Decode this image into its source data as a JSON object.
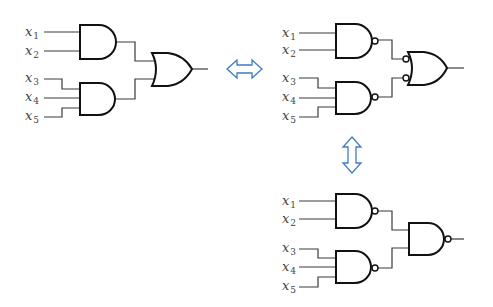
{
  "diagram": {
    "type": "logic-circuit-equivalence",
    "circuits": [
      {
        "id": "and-or",
        "position": "top-left",
        "inputs": [
          {
            "var": "x",
            "sub": "1"
          },
          {
            "var": "x",
            "sub": "2"
          },
          {
            "var": "x",
            "sub": "3"
          },
          {
            "var": "x",
            "sub": "4"
          },
          {
            "var": "x",
            "sub": "5"
          }
        ],
        "gates": [
          {
            "name": "and-gate-1",
            "kind": "AND",
            "inputs": [
              "x1",
              "x2"
            ]
          },
          {
            "name": "and-gate-2",
            "kind": "AND",
            "inputs": [
              "x3",
              "x4",
              "x5"
            ]
          },
          {
            "name": "or-gate",
            "kind": "OR",
            "inputs": [
              "and-gate-1",
              "and-gate-2"
            ]
          }
        ]
      },
      {
        "id": "nand-negated-or",
        "position": "top-right",
        "inputs": [
          {
            "var": "x",
            "sub": "1"
          },
          {
            "var": "x",
            "sub": "2"
          },
          {
            "var": "x",
            "sub": "3"
          },
          {
            "var": "x",
            "sub": "4"
          },
          {
            "var": "x",
            "sub": "5"
          }
        ],
        "gates": [
          {
            "name": "nand-gate-1",
            "kind": "NAND",
            "inputs": [
              "x1",
              "x2"
            ]
          },
          {
            "name": "nand-gate-2",
            "kind": "NAND",
            "inputs": [
              "x3",
              "x4",
              "x5"
            ]
          },
          {
            "name": "or-gate-inverted-inputs",
            "kind": "OR (inverted inputs)",
            "inputs": [
              "nand-gate-1",
              "nand-gate-2"
            ]
          }
        ]
      },
      {
        "id": "nand-nand",
        "position": "bottom-right",
        "inputs": [
          {
            "var": "x",
            "sub": "1"
          },
          {
            "var": "x",
            "sub": "2"
          },
          {
            "var": "x",
            "sub": "3"
          },
          {
            "var": "x",
            "sub": "4"
          },
          {
            "var": "x",
            "sub": "5"
          }
        ],
        "gates": [
          {
            "name": "nand-gate-1",
            "kind": "NAND",
            "inputs": [
              "x1",
              "x2"
            ]
          },
          {
            "name": "nand-gate-2",
            "kind": "NAND",
            "inputs": [
              "x3",
              "x4",
              "x5"
            ]
          },
          {
            "name": "nand-gate-3",
            "kind": "NAND",
            "inputs": [
              "nand-gate-1",
              "nand-gate-2"
            ]
          }
        ]
      }
    ],
    "arrows": [
      {
        "name": "equivalence-arrow-horizontal",
        "direction": "left-right"
      },
      {
        "name": "equivalence-arrow-vertical",
        "direction": "up-down"
      }
    ],
    "colors": {
      "wire": "#3a3a3a",
      "gate": "#111111",
      "label": "#444444",
      "arrow": "#3f7cc4"
    }
  }
}
